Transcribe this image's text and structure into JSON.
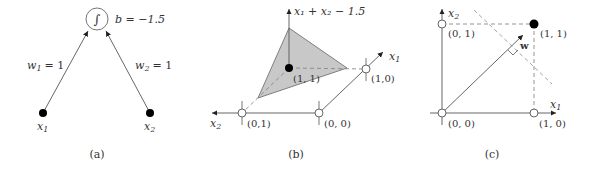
{
  "panel_a": {
    "caption": "(a)",
    "neuron_glyph": "∫",
    "bias_label": "b = −1.5",
    "weights": [
      {
        "name": "w",
        "sub": "1",
        "value": "= 1"
      },
      {
        "name": "w",
        "sub": "2",
        "value": "= 1"
      }
    ],
    "inputs": [
      {
        "name": "x",
        "sub": "1"
      },
      {
        "name": "x",
        "sub": "2"
      }
    ]
  },
  "panel_b": {
    "caption": "(b)",
    "z_axis_label": "x₁ + x₂ − 1.5",
    "x1_axis": {
      "name": "x",
      "sub": "1"
    },
    "x2_axis": {
      "name": "x",
      "sub": "2"
    },
    "points": [
      {
        "label": "(1, 1)",
        "filled": true
      },
      {
        "label": "(1,0)",
        "filled": false
      },
      {
        "label": "(0, 0)",
        "filled": false
      },
      {
        "label": "(0,1)",
        "filled": false
      }
    ]
  },
  "panel_c": {
    "caption": "(c)",
    "x1_axis": {
      "name": "x",
      "sub": "1"
    },
    "x2_axis": {
      "name": "x",
      "sub": "2"
    },
    "weight_vector_label": "w",
    "points": [
      {
        "label": "(0, 1)",
        "filled": false
      },
      {
        "label": "(1, 1)",
        "filled": true
      },
      {
        "label": "(0, 0)",
        "filled": false
      },
      {
        "label": "(1, 0)",
        "filled": false
      }
    ]
  },
  "colors": {
    "line": "#555555",
    "dashed": "#888888",
    "fill_plane": "#c8c8c8",
    "point_filled": "#000000",
    "point_empty": "#ffffff"
  }
}
